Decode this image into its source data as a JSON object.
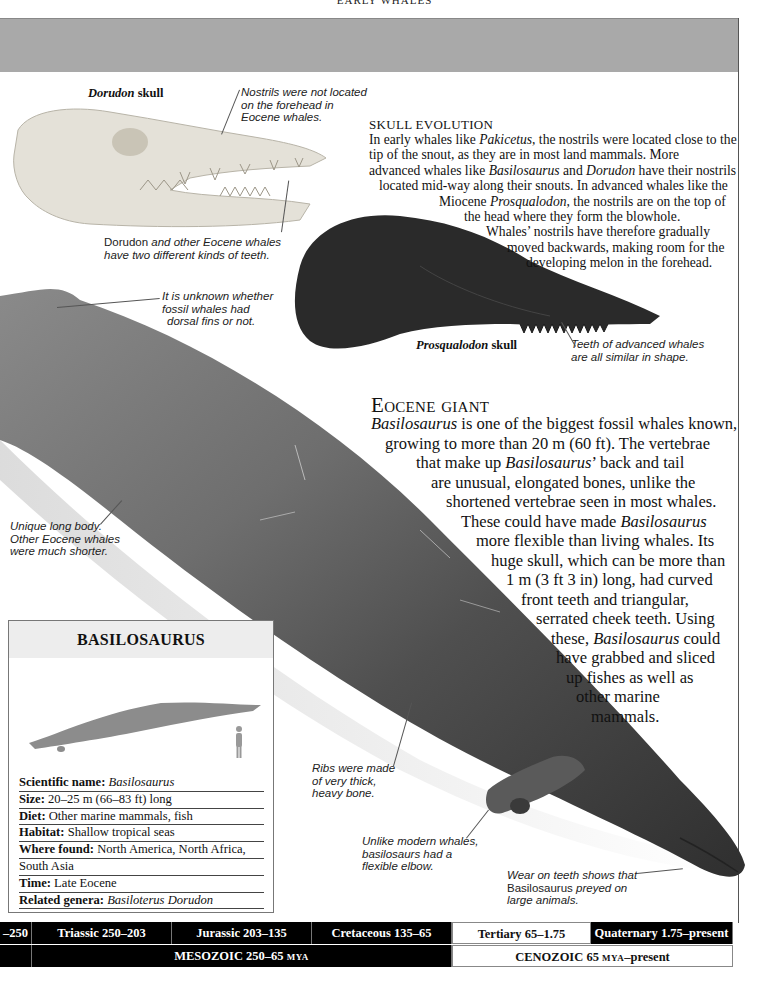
{
  "page": {
    "running_head": "EARLY WHALES",
    "colors": {
      "header_band": "#a9a9a9",
      "whale_body": "#4a4a4a",
      "fossil_dark": "#2a2a2a",
      "bone_light": "#e4e1d8",
      "timeline_dark": "#000000",
      "factbox_header": "#ededed",
      "silhouette": "#8c8c8c"
    }
  },
  "dorudon": {
    "label_italic": "Dorudon",
    "label_rest": " skull",
    "caption_nostrils": [
      "Nostrils were not located",
      "on the forehead in",
      "Eocene whales."
    ],
    "caption_teeth_1": "Dorudon",
    "caption_teeth_1_rest": " and other Eocene whales",
    "caption_teeth_2": "have two different kinds of teeth."
  },
  "skull_evolution": {
    "title": "SKULL EVOLUTION",
    "lines": [
      [
        {
          "t": "In early whales like "
        },
        {
          "t": "Pakicetus",
          "i": true
        },
        {
          "t": ", the nostrils were located close to the"
        }
      ],
      [
        {
          "t": "tip of the snout, as they are in most land mammals. More"
        }
      ],
      [
        {
          "t": "advanced whales like "
        },
        {
          "t": "Basilosaurus",
          "i": true
        },
        {
          "t": " and "
        },
        {
          "t": "Dorudon",
          "i": true
        },
        {
          "t": " have their nostrils"
        }
      ],
      [
        {
          "t": "located mid-way along their snouts. In advanced whales like the"
        }
      ],
      [
        {
          "t": "Miocene "
        },
        {
          "t": "Prosqualodon",
          "i": true
        },
        {
          "t": ", the nostrils are on the top of"
        }
      ],
      [
        {
          "t": "the head where they form the blowhole."
        }
      ],
      [
        {
          "t": "Whales’ nostrils have therefore gradually"
        }
      ],
      [
        {
          "t": "moved backwards, making room for the"
        }
      ],
      [
        {
          "t": "developing melon in the forehead."
        }
      ]
    ]
  },
  "prosqualodon": {
    "label_italic": "Prosqualodon",
    "label_rest": " skull",
    "caption_teeth": [
      "Teeth of advanced whales",
      "are all similar in shape."
    ]
  },
  "whale_captions": {
    "dorsal": [
      "It is unknown whether",
      "fossil whales had",
      "dorsal fins or not."
    ],
    "body": [
      "Unique long body.",
      "Other Eocene whales",
      "were much shorter."
    ],
    "ribs": [
      "Ribs were made",
      "of very thick,",
      "heavy bone."
    ],
    "elbow": [
      "Unlike modern whales,",
      "basilosaurs had a",
      "flexible elbow."
    ],
    "teeth_wear_1": "Wear on teeth shows that",
    "teeth_wear_2a": "Basilosaurus",
    "teeth_wear_2b": " preyed on",
    "teeth_wear_3": "large animals."
  },
  "eocene_giant": {
    "title": "Eocene giant",
    "lines": [
      [
        {
          "t": "Basilosaurus",
          "i": true
        },
        {
          "t": " is one of the biggest fossil whales known,"
        }
      ],
      [
        {
          "t": "growing to more than 20 m (60 ft). The vertebrae"
        }
      ],
      [
        {
          "t": "that make up "
        },
        {
          "t": "Basilosaurus",
          "i": true
        },
        {
          "t": "’ back and tail"
        }
      ],
      [
        {
          "t": "are unusual, elongated bones, unlike the"
        }
      ],
      [
        {
          "t": "shortened vertebrae seen in most whales."
        }
      ],
      [
        {
          "t": "These could have made "
        },
        {
          "t": "Basilosaurus",
          "i": true
        }
      ],
      [
        {
          "t": "more flexible than living whales. Its"
        }
      ],
      [
        {
          "t": "huge skull, which can be more than"
        }
      ],
      [
        {
          "t": "1 m (3 ft 3 in) long, had curved"
        }
      ],
      [
        {
          "t": "front teeth and triangular,"
        }
      ],
      [
        {
          "t": "serrated cheek teeth. Using"
        }
      ],
      [
        {
          "t": "these, "
        },
        {
          "t": "Basilosaurus",
          "i": true
        },
        {
          "t": " could"
        }
      ],
      [
        {
          "t": "have grabbed and sliced"
        }
      ],
      [
        {
          "t": "up fishes as well as"
        }
      ],
      [
        {
          "t": "other marine"
        }
      ],
      [
        {
          "t": "mammals."
        }
      ]
    ]
  },
  "factbox": {
    "title": "BASILOSAURUS",
    "rows": [
      {
        "label": "Scientific name:",
        "value": " Basilosaurus",
        "italic": true
      },
      {
        "label": "Size:",
        "value": " 20–25 m (66–83 ft) long",
        "italic": false
      },
      {
        "label": "Diet:",
        "value": " Other marine mammals, fish",
        "italic": false
      },
      {
        "label": "Habitat:",
        "value": " Shallow tropical seas",
        "italic": false
      },
      {
        "label": "Where found:",
        "value": " North America, North Africa,",
        "italic": false
      },
      {
        "label": "",
        "value": "South Asia",
        "italic": false
      },
      {
        "label": "Time:",
        "value": " Late Eocene",
        "italic": false
      },
      {
        "label": "Related genera:",
        "value": " Basiloterus Dorudon",
        "italic": true
      }
    ]
  },
  "timeline": {
    "periods": [
      {
        "label": "–250",
        "dark": true
      },
      {
        "label": "Triassic 250–203",
        "dark": true
      },
      {
        "label": "Jurassic 203–135",
        "dark": true
      },
      {
        "label": "Cretaceous 135–65",
        "dark": true
      },
      {
        "label": "Tertiary 65–1.75",
        "dark": false
      },
      {
        "label": "Quaternary 1.75–present",
        "dark": true
      }
    ],
    "eras": [
      {
        "label": "",
        "dark": true
      },
      {
        "label": "MESOZOIC 250–65 ",
        "unit": "MYA",
        "dark": true
      },
      {
        "label": "CENOZOIC 65 ",
        "unit": "MYA",
        "suffix": "–present",
        "dark": false
      }
    ]
  }
}
